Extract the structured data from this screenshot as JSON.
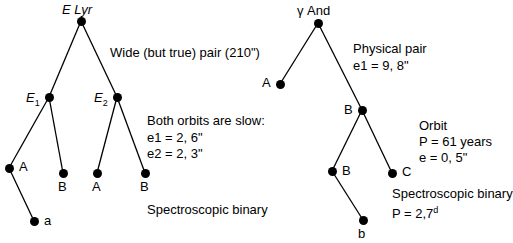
{
  "diagram": {
    "background": "#ffffff",
    "ink": "#000000",
    "systems": [
      {
        "id": "epsilon-lyrae",
        "root_label": "E Lyr",
        "nodes": [
          {
            "id": "elyr-root",
            "label": "E Lyr",
            "label_style": "italic-first",
            "x": 81,
            "y": 21,
            "label_x": 62,
            "label_y": 3,
            "label_align": "left"
          },
          {
            "id": "elyr-e1",
            "label": "E1",
            "label_style": "italic-sub",
            "x": 49,
            "y": 97,
            "label_x": 26,
            "label_y": 91,
            "label_align": "left"
          },
          {
            "id": "elyr-e2",
            "label": "E2",
            "label_style": "italic-sub",
            "x": 117,
            "y": 97,
            "label_x": 94,
            "label_y": 91,
            "label_align": "left"
          },
          {
            "id": "elyr-e1-a",
            "label": "A",
            "label_style": "plain",
            "x": 9,
            "y": 168,
            "label_x": 19,
            "label_y": 160,
            "label_align": "left"
          },
          {
            "id": "elyr-e1-b",
            "label": "B",
            "label_style": "plain",
            "x": 63,
            "y": 173,
            "label_x": 58,
            "label_y": 180,
            "label_align": "left"
          },
          {
            "id": "elyr-e2-a",
            "label": "A",
            "label_style": "plain",
            "x": 97,
            "y": 173,
            "label_x": 92,
            "label_y": 180,
            "label_align": "left"
          },
          {
            "id": "elyr-e2-b",
            "label": "B",
            "label_style": "plain",
            "x": 145,
            "y": 173,
            "label_x": 140,
            "label_y": 180,
            "label_align": "left"
          },
          {
            "id": "elyr-a-sb",
            "label": "a",
            "label_style": "plain",
            "x": 34,
            "y": 221,
            "label_x": 44,
            "label_y": 214,
            "label_align": "left"
          }
        ],
        "edges": [
          [
            "elyr-root",
            "elyr-e1"
          ],
          [
            "elyr-root",
            "elyr-e2"
          ],
          [
            "elyr-e1",
            "elyr-e1-a"
          ],
          [
            "elyr-e1",
            "elyr-e1-b"
          ],
          [
            "elyr-e2",
            "elyr-e2-a"
          ],
          [
            "elyr-e2",
            "elyr-e2-b"
          ],
          [
            "elyr-e1-a",
            "elyr-a-sb"
          ]
        ],
        "annotations": [
          {
            "id": "elyr-wide-pair",
            "x": 110,
            "y": 45,
            "lines": [
              "Wide (but true) pair (210\")"
            ]
          },
          {
            "id": "elyr-orbits",
            "x": 147,
            "y": 113,
            "lines": [
              "Both orbits are slow:"
            ]
          },
          {
            "id": "elyr-eccent",
            "x": 147,
            "y": 129,
            "lines": [
              "e1 = 2, 6\"",
              "e2 = 2, 3\""
            ]
          },
          {
            "id": "elyr-spectro",
            "x": 147,
            "y": 202,
            "lines": [
              "Spectroscopic binary"
            ]
          }
        ]
      },
      {
        "id": "gamma-andromedae",
        "root_label": "γ And",
        "nodes": [
          {
            "id": "gand-root",
            "label": "γ And",
            "label_style": "greek",
            "x": 318,
            "y": 23,
            "label_x": 297,
            "label_y": 4,
            "label_align": "left"
          },
          {
            "id": "gand-a",
            "label": "A",
            "label_style": "plain",
            "x": 280,
            "y": 84,
            "label_x": 262,
            "label_y": 76,
            "label_align": "left"
          },
          {
            "id": "gand-b",
            "label": "B",
            "label_style": "plain",
            "x": 362,
            "y": 110,
            "label_x": 344,
            "label_y": 103,
            "label_align": "left"
          },
          {
            "id": "gand-b2",
            "label": "B",
            "label_style": "plain",
            "x": 332,
            "y": 171,
            "label_x": 342,
            "label_y": 164,
            "label_align": "left"
          },
          {
            "id": "gand-c",
            "label": "C",
            "label_style": "plain",
            "x": 392,
            "y": 173,
            "label_x": 402,
            "label_y": 165,
            "label_align": "left"
          },
          {
            "id": "gand-b-sb",
            "label": "b",
            "label_style": "plain",
            "x": 363,
            "y": 220,
            "label_x": 358,
            "label_y": 227,
            "label_align": "left"
          }
        ],
        "edges": [
          [
            "gand-root",
            "gand-a"
          ],
          [
            "gand-root",
            "gand-b"
          ],
          [
            "gand-b",
            "gand-b2"
          ],
          [
            "gand-b",
            "gand-c"
          ],
          [
            "gand-b2",
            "gand-b-sb"
          ]
        ],
        "annotations": [
          {
            "id": "gand-physical",
            "x": 353,
            "y": 41,
            "lines": [
              "Physical pair",
              "e1 = 9, 8\""
            ]
          },
          {
            "id": "gand-orbit",
            "x": 419,
            "y": 118,
            "lines": [
              "Orbit",
              "P = 61 years",
              "e = 0, 5\""
            ]
          },
          {
            "id": "gand-spectro",
            "x": 392,
            "y": 186,
            "lines": [
              "Spectroscopic binary"
            ]
          },
          {
            "id": "gand-period",
            "x": 392,
            "y": 200,
            "lines": [
              "P = 2,7"
            ],
            "superscript": "d"
          }
        ]
      }
    ]
  }
}
